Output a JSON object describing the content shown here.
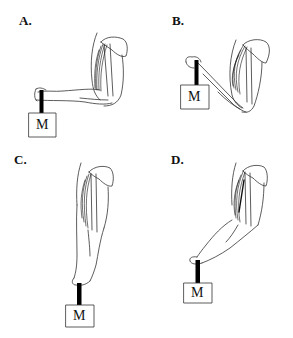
{
  "figure": {
    "top_cut_text": "",
    "panels": [
      {
        "label": "A.",
        "mass_label": "M",
        "description": "Forearm horizontal, elbow flexed at 90 degrees, mass hanging from hand"
      },
      {
        "label": "B.",
        "mass_label": "M",
        "description": "Forearm raised above horizontal, elbow flexed acutely, mass held up"
      },
      {
        "label": "C.",
        "mass_label": "M",
        "description": "Arm fully extended straight down, mass hanging from hand"
      },
      {
        "label": "D.",
        "mass_label": "M",
        "description": "Arm extended downward at an angle, mass hanging from hand"
      }
    ]
  }
}
